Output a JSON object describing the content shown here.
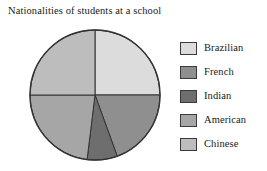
{
  "chart_data": {
    "type": "pie",
    "title": "Nationalities of students at a school",
    "xlabel": "",
    "ylabel": "",
    "legend_position": "right",
    "grid": false,
    "categories": [
      "Brazilian",
      "French",
      "Indian",
      "American",
      "Chinese"
    ],
    "values": [
      25,
      19.5,
      7.5,
      23,
      25
    ],
    "units": "percent",
    "slices": [
      {
        "label": "Brazilian",
        "value": 25,
        "start_angle_deg": 0,
        "end_angle_deg": 90,
        "color": "#dcdcdc"
      },
      {
        "label": "French",
        "value": 19.5,
        "start_angle_deg": 90,
        "end_angle_deg": 160,
        "color": "#8f8f8f"
      },
      {
        "label": "Indian",
        "value": 7.5,
        "start_angle_deg": 160,
        "end_angle_deg": 187,
        "color": "#6e6e6e"
      },
      {
        "label": "American",
        "value": 23,
        "start_angle_deg": 187,
        "end_angle_deg": 270,
        "color": "#a6a6a6"
      },
      {
        "label": "Chinese",
        "value": 25,
        "start_angle_deg": 270,
        "end_angle_deg": 360,
        "color": "#bdbdbd"
      }
    ],
    "geometry": {
      "center_x": 95,
      "center_y": 95,
      "radius": 65,
      "outline_color": "#333333"
    }
  },
  "legend": {
    "items": [
      {
        "label": "Brazilian",
        "color": "#dcdcdc"
      },
      {
        "label": "French",
        "color": "#8f8f8f"
      },
      {
        "label": "Indian",
        "color": "#6e6e6e"
      },
      {
        "label": "American",
        "color": "#a6a6a6"
      },
      {
        "label": "Chinese",
        "color": "#bdbdbd"
      }
    ]
  }
}
